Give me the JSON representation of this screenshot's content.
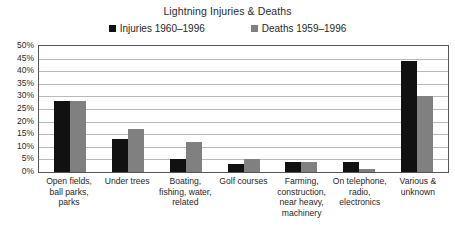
{
  "chart_data": {
    "type": "bar",
    "title": "Lightning Injuries & Deaths",
    "xlabel": "",
    "ylabel": "",
    "ylim": [
      0,
      50
    ],
    "ytick_labels": [
      "50%",
      "45%",
      "40%",
      "35%",
      "30%",
      "25%",
      "20%",
      "15%",
      "10%",
      "5%",
      "0%"
    ],
    "ytick_values": [
      50,
      45,
      40,
      35,
      30,
      25,
      20,
      15,
      10,
      5,
      0
    ],
    "grid": true,
    "legend_position": "top-center",
    "categories": [
      "Open fields, ball parks, parks",
      "Under trees",
      "Boating, fishing, water, related",
      "Golf courses",
      "Farming, construction, near heavy, machinery",
      "On telephone, radio, electronics",
      "Various & unknown"
    ],
    "category_lines": [
      [
        "Open fields,",
        "ball parks,",
        "parks"
      ],
      [
        "Under trees"
      ],
      [
        "Boating,",
        "fishing, water,",
        "related"
      ],
      [
        "Golf courses"
      ],
      [
        "Farming,",
        "construction,",
        "near heavy,",
        "machinery"
      ],
      [
        "On telephone,",
        "radio,",
        "electronics"
      ],
      [
        "Various &",
        "unknown"
      ]
    ],
    "series": [
      {
        "name": "Injuries 1960–1996",
        "color": "#111111",
        "values": [
          28,
          13,
          5,
          3,
          4,
          4,
          44
        ]
      },
      {
        "name": "Deaths 1959–1996",
        "color": "#808080",
        "values": [
          28,
          17,
          12,
          5,
          4,
          1,
          30
        ]
      }
    ]
  }
}
